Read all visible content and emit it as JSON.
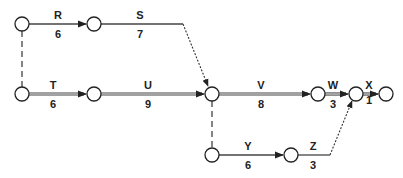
{
  "diagram": {
    "type": "activity-on-arrow network",
    "nodes": [
      {
        "id": "n1",
        "x": 22,
        "y": 24
      },
      {
        "id": "n2",
        "x": 94,
        "y": 24
      },
      {
        "id": "n3",
        "x": 22,
        "y": 94
      },
      {
        "id": "n4",
        "x": 94,
        "y": 94
      },
      {
        "id": "n5",
        "x": 212,
        "y": 94
      },
      {
        "id": "n6",
        "x": 318,
        "y": 94
      },
      {
        "id": "n7",
        "x": 356,
        "y": 94
      },
      {
        "id": "n8",
        "x": 386,
        "y": 94
      },
      {
        "id": "n9",
        "x": 212,
        "y": 155
      },
      {
        "id": "n10",
        "x": 291,
        "y": 155
      }
    ],
    "activities": [
      {
        "name": "R",
        "duration": "6",
        "from": "n1",
        "to": "n2",
        "style": "single"
      },
      {
        "name": "S",
        "duration": "7",
        "from": "n2",
        "to": "n5",
        "style": "single-to-dotted"
      },
      {
        "name": "T",
        "duration": "6",
        "from": "n3",
        "to": "n4",
        "style": "double"
      },
      {
        "name": "U",
        "duration": "9",
        "from": "n4",
        "to": "n5",
        "style": "double"
      },
      {
        "name": "V",
        "duration": "8",
        "from": "n5",
        "to": "n6",
        "style": "double"
      },
      {
        "name": "W",
        "duration": "3",
        "from": "n6",
        "to": "n7",
        "style": "double"
      },
      {
        "name": "X",
        "duration": "1",
        "from": "n7",
        "to": "n8",
        "style": "double"
      },
      {
        "name": "Y",
        "duration": "6",
        "from": "n9",
        "to": "n10",
        "style": "single"
      },
      {
        "name": "Z",
        "duration": "3",
        "from": "n10",
        "to": "n7",
        "style": "single-to-dotted"
      }
    ],
    "dummies": [
      {
        "from": "n1",
        "to": "n3"
      },
      {
        "from": "n5",
        "to": "n9"
      }
    ],
    "labels": {
      "R": "R",
      "R_d": "6",
      "S": "S",
      "S_d": "7",
      "T": "T",
      "T_d": "6",
      "U": "U",
      "U_d": "9",
      "V": "V",
      "V_d": "8",
      "W": "W",
      "W_d": "3",
      "X": "X",
      "X_d": "1",
      "Y": "Y",
      "Y_d": "6",
      "Z": "Z",
      "Z_d": "3"
    }
  }
}
